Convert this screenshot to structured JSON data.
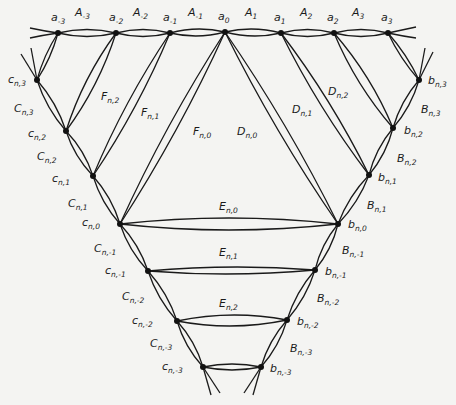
{
  "figure": {
    "top_vertices": [
      {
        "id": "a-3",
        "label": "a",
        "sub": "-3",
        "x": 58,
        "y": 33
      },
      {
        "id": "a-2",
        "label": "a",
        "sub": "-2",
        "x": 116,
        "y": 33
      },
      {
        "id": "a-1",
        "label": "a",
        "sub": "-1",
        "x": 170,
        "y": 33
      },
      {
        "id": "a0",
        "label": "a",
        "sub": "0",
        "x": 225,
        "y": 32
      },
      {
        "id": "a1",
        "label": "a",
        "sub": "1",
        "x": 281,
        "y": 33
      },
      {
        "id": "a2",
        "label": "a",
        "sub": "2",
        "x": 334,
        "y": 33
      },
      {
        "id": "a3",
        "label": "a",
        "sub": "3",
        "x": 388,
        "y": 33
      }
    ],
    "top_edges": [
      {
        "label": "A",
        "sub": "-3",
        "x": 75,
        "y": 16
      },
      {
        "label": "A",
        "sub": "-2",
        "x": 133,
        "y": 16
      },
      {
        "label": "A",
        "sub": "-1",
        "x": 188,
        "y": 16
      },
      {
        "label": "A",
        "sub": "1",
        "x": 245,
        "y": 16
      },
      {
        "label": "A",
        "sub": "2",
        "x": 300,
        "y": 16
      },
      {
        "label": "A",
        "sub": "3",
        "x": 352,
        "y": 16
      }
    ],
    "left_vertices": [
      {
        "id": "c3",
        "label": "c",
        "sub": "n,3",
        "x": 37,
        "y": 80,
        "lx": 8,
        "ly": 83
      },
      {
        "id": "c2",
        "label": "c",
        "sub": "n,2",
        "x": 66,
        "y": 131,
        "lx": 28,
        "ly": 137
      },
      {
        "id": "c1",
        "label": "c",
        "sub": "n,1",
        "x": 93,
        "y": 176,
        "lx": 52,
        "ly": 182
      },
      {
        "id": "c0",
        "label": "c",
        "sub": "n,0",
        "x": 120,
        "y": 224,
        "lx": 82,
        "ly": 226
      },
      {
        "id": "c-1",
        "label": "c",
        "sub": "n,-1",
        "x": 148,
        "y": 271,
        "lx": 105,
        "ly": 274
      },
      {
        "id": "c-2",
        "label": "c",
        "sub": "n,-2",
        "x": 177,
        "y": 321,
        "lx": 132,
        "ly": 324
      },
      {
        "id": "c-3",
        "label": "c",
        "sub": "n,-3",
        "x": 203,
        "y": 367,
        "lx": 162,
        "ly": 370
      }
    ],
    "right_vertices": [
      {
        "id": "b3",
        "label": "b",
        "sub": "n,3",
        "x": 419,
        "y": 80,
        "lx": 428,
        "ly": 84
      },
      {
        "id": "b2",
        "label": "b",
        "sub": "n,2",
        "x": 393,
        "y": 128,
        "lx": 404,
        "ly": 134
      },
      {
        "id": "b1",
        "label": "b",
        "sub": "n,1",
        "x": 369,
        "y": 175,
        "lx": 378,
        "ly": 181
      },
      {
        "id": "b0",
        "label": "b",
        "sub": "n,0",
        "x": 338,
        "y": 224,
        "lx": 348,
        "ly": 228
      },
      {
        "id": "b-1",
        "label": "b",
        "sub": "n,-1",
        "x": 315,
        "y": 270,
        "lx": 325,
        "ly": 275
      },
      {
        "id": "b-2",
        "label": "b",
        "sub": "n,-2",
        "x": 287,
        "y": 320,
        "lx": 297,
        "ly": 325
      },
      {
        "id": "b-3",
        "label": "b",
        "sub": "n,-3",
        "x": 261,
        "y": 367,
        "lx": 270,
        "ly": 372
      }
    ],
    "left_edge_labels": [
      {
        "label": "C",
        "sub": "n,3",
        "x": 14,
        "y": 112
      },
      {
        "label": "C",
        "sub": "n,2",
        "x": 37,
        "y": 160
      },
      {
        "label": "C",
        "sub": "n,1",
        "x": 68,
        "y": 207
      },
      {
        "label": "C",
        "sub": "n,-1",
        "x": 94,
        "y": 252
      },
      {
        "label": "C",
        "sub": "n,-2",
        "x": 122,
        "y": 300
      },
      {
        "label": "C",
        "sub": "n,-3",
        "x": 150,
        "y": 347
      }
    ],
    "right_edge_labels": [
      {
        "label": "B",
        "sub": "n,3",
        "x": 421,
        "y": 113
      },
      {
        "label": "B",
        "sub": "n,2",
        "x": 397,
        "y": 162
      },
      {
        "label": "B",
        "sub": "n,1",
        "x": 367,
        "y": 209
      },
      {
        "label": "B",
        "sub": "n,-1",
        "x": 342,
        "y": 254
      },
      {
        "label": "B",
        "sub": "n,-2",
        "x": 317,
        "y": 302
      },
      {
        "label": "B",
        "sub": "n,-3",
        "x": 290,
        "y": 352
      }
    ],
    "fan_labels": [
      {
        "label": "F",
        "sub": "n,2",
        "x": 101,
        "y": 100
      },
      {
        "label": "F",
        "sub": "n,1",
        "x": 141,
        "y": 116
      },
      {
        "label": "F",
        "sub": "n,0",
        "x": 193,
        "y": 135
      },
      {
        "label": "D",
        "sub": "n,0",
        "x": 237,
        "y": 135
      },
      {
        "label": "D",
        "sub": "n,1",
        "x": 292,
        "y": 113
      },
      {
        "label": "D",
        "sub": "n,2",
        "x": 328,
        "y": 95
      }
    ],
    "horizontal_labels": [
      {
        "label": "E",
        "sub": "n,0",
        "x": 219,
        "y": 210
      },
      {
        "label": "E",
        "sub": "n,1",
        "x": 219,
        "y": 256
      },
      {
        "label": "E",
        "sub": "n,2",
        "x": 219,
        "y": 307
      }
    ]
  }
}
